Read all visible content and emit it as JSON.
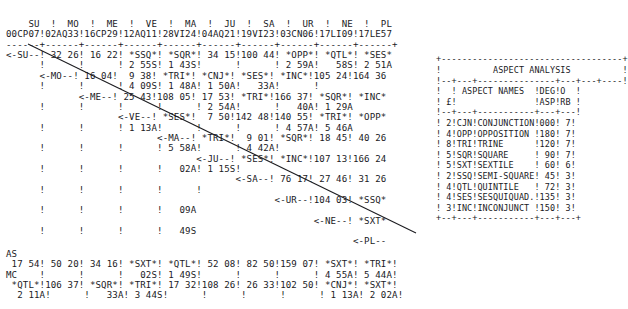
{
  "document": {
    "kind": "astrology-aspect-grid-printout",
    "ink_color": "#1a1a1e",
    "paper_color": "#ffffff"
  },
  "grid": {
    "planet_abbreviations": [
      "SU",
      "MO",
      "ME",
      "VE",
      "MA",
      "JU",
      "SA",
      "UR",
      "NE",
      "PL"
    ],
    "positions": [
      "00CP07",
      "02AQ33",
      "16CP29",
      "12AQ11",
      "28VI24",
      "04AQ21",
      "19VI23",
      "03CN06",
      "17LI09",
      "17LE57"
    ],
    "header_line_1": "    SU  !  MO  !  ME  !  VE  !  MA  !  JU  !  SA  !  UR  !  NE  !  PL  ",
    "header_line_2": "00CP07!02AQ33!16CP29!12AQ11!28VI24!04AQ21!19VI23!03CN06!17LI09!17LE57",
    "rule_line": "------+------+------+------+------+------+------+------+------+------+",
    "rows": [
      "<-SU--! 32 26! 16 22! *SSQ*! *SQR*! 34 15!100 44! *OPP*! *QTL*! *SES*",
      "      !      !      ! 2 55S! 1 43S!      !      ! 2 59A!   58S! 2 51A",
      "      <-MO--! 16 04!  9 38! *TRI*! *CNJ*! *SES*! *INC*!105 24!164 36",
      "      !      !      ! 4 09S! 1 48A! 1 50A!   33A!      !      ",
      "             <-ME--! 25 43!108 05! 17 53! *TRI*!166 37! *SQR*! *INC*",
      "      !      !      !      ! 2 54A!      !   40A! 1 29A",
      "                    <-VE--! *SES*!  7 50!142 48!140 55! *TRI*! *OPP*",
      "      !      ! 1 13A!      !      !      ! 4 57A! 5 46A",
      "                           <-MA--! *TRI*!  9 01! *SQR*! 18 45! 40 26",
      "      !      ! 5 58A!      ! 4 42A!      !      ",
      "                                  <-JU--! *SES*! *INC*!107 13!166 24",
      "      !      !   02A! 1 15S!      !      ",
      "                                         <-SA--! 76 17! 27 46! 31 26",
      "      !      !      !      !      ",
      "                                                <-UR--!104 03! *SSQ*",
      "      !      !      !   09A",
      "                                                       <-NE--! *SXT*",
      "      !      !   49S",
      "                                                              <-PL--"
    ],
    "body_text": "    SU  !  MO  !  ME  !  VE  !  MA  !  JU  !  SA  !  UR  !  NE  !  PL\n00CP07!02AQ33!16CP29!12AQ11!28VI24!04AQ21!19VI23!03CN06!17LI09!17LE57\n------+------+------+------+------+------+------+------+------+------+\n<-SU--! 32 26! 16 22! *SSQ*! *SQR*! 34 15!100 44! *OPP*! *QTL*! *SES*\n      !      !      ! 2 55S! 1 43S!      !      ! 2 59A!   58S! 2 51A\n      <-MO--! 16 04!  9 38! *TRI*! *CNJ*! *SES*! *INC*!105 24!164 36\n      !      !      ! 4 09S! 1 48A! 1 50A!   33A!      !      \n             <-ME--! 25 43!108 05! 17 53! *TRI*!166 37! *SQR*! *INC*\n      !      !      !      !      ! 2 54A!      !   40A! 1 29A\n                    <-VE--! *SES*!  7 50!142 48!140 55! *TRI*! *OPP*\n      !      !      ! 1 13A!      !      !      ! 4 57A! 5 46A\n                           <-MA--! *TRI*!  9 01! *SQR*! 18 45! 40 26\n      !      !      !      ! 5 58A!      ! 4 42A!      \n                                  <-JU--! *SES*! *INC*!107 13!166 24\n      !      !      !      !   02A! 1 15S!      \n                                         <-SA--! 76 17! 27 46! 31 26\n      !      !      !      !      !      \n                                                <-UR--!104 03! *SSQ*\n      !      !      !      !   09A\n                                                       <-NE--! *SXT*\n      !      !      !      !   49S\n                                                              <-PL--"
  },
  "angles": {
    "as_label": "AS",
    "mc_label": "MC",
    "as_values": " 17 54! 50 20! 34 16! *SXT*! *QTL*! 52 08! 82 50!159 07! *SXT*! *TRI*",
    "as_orbs": "       !      !      !   02S! 1 49S!      !      !      ! 4 55A! 5 44A",
    "mc_values": " *QTL*!106 37! *SQR*! *TRI*! 17 32!108 26! 26 33!102 50! *CNJ*! *SXT*",
    "mc_orbs": "  2 11A!      !   33A! 3 44S!      !      !      !      ! 1 13A! 2 02A",
    "body_text": "AS\n 17 54! 50 20! 34 16! *SXT*! *QTL*! 52 08! 82 50!159 07! *SXT*! *TRI*!\nMC    !      !      !   02S! 1 49S!      !      !      ! 4 55A! 5 44A!\n *QTL*!106 37! *SQR*! *TRI*! 17 32!108 26! 26 33!102 50! *CNJ*! *SXT*!\n  2 11A!      !   33A! 3 44S!      !      !      !      ! 1 13A! 2 02A!"
  },
  "analysis": {
    "title": "ASPECT ANALYSIS",
    "column_headers": {
      "count": "£",
      "abbrev": "",
      "name": "ASPECT NAMES",
      "degree_line1": "DEG",
      "degree_line2": "ASP",
      "orb_line1": "O",
      "orb_line2": "RB"
    },
    "rows": [
      {
        "count": "2",
        "abbrev": "CJN",
        "name": "CONJUNCTION",
        "degree": "000",
        "orb": "7"
      },
      {
        "count": "4",
        "abbrev": "OPP",
        "name": "OPPOSITION",
        "degree": "180",
        "orb": "7"
      },
      {
        "count": "8",
        "abbrev": "TRI",
        "name": "TRINE",
        "degree": "120",
        "orb": "7"
      },
      {
        "count": "5",
        "abbrev": "SQR",
        "name": "SQUARE",
        "degree": "090",
        "orb": "7"
      },
      {
        "count": "5",
        "abbrev": "SXT",
        "name": "SEXTILE",
        "degree": "060",
        "orb": "6"
      },
      {
        "count": "2",
        "abbrev": "SSQ",
        "name": "SEMI-SQUARE",
        "degree": "045",
        "orb": "3"
      },
      {
        "count": "4",
        "abbrev": "QTL",
        "name": "QUINTILE",
        "degree": "072",
        "orb": "3"
      },
      {
        "count": "4",
        "abbrev": "SES",
        "name": "SESQUIQUAD.",
        "degree": "135",
        "orb": "3"
      },
      {
        "count": "3",
        "abbrev": "INC",
        "name": "INCONJUNCT",
        "degree": "150",
        "orb": "3"
      }
    ],
    "body_text": "+-----------------------------------+\n!          ASPECT ANALYSIS          !\n!--+---+---------------+---+---+----!\n!  ! ASPECT NAMES  !DEG!O  !\n! £!               !ASP!RB !\n!--+---+-----------+---+---!\n! 2!CJN!CONJUNCTION!000! 7!\n! 4!OPP!OPPOSITION !180! 7!\n! 8!TRI!TRINE      !120! 7!\n! 5!SQR!SQUARE     ! 90! 7!\n! 5!SXT!SEXTILE    ! 60! 6!\n! 2!SSQ!SEMI-SQUARE! 45! 3!\n! 4!QTL!QUINTILE   ! 72! 3!\n! 4!SES!SESQUIQUAD.!135! 3!\n! 3!INC!INCONJUNCT !150! 3!\n+--+---+-----------+---+---+"
  },
  "diagonal": {
    "description": "hand-drawn rule separating upper-right aspect cells from blank lower-left",
    "x1": 28,
    "y1": 44,
    "x2": 416,
    "y2": 233
  }
}
